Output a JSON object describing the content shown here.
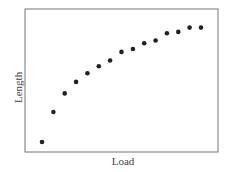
{
  "chart_data": {
    "type": "scatter",
    "title": "",
    "xlabel": "Load",
    "ylabel": "Length",
    "x": [
      1,
      2,
      3,
      4,
      5,
      6,
      7,
      8,
      9,
      10,
      11,
      12,
      13,
      14,
      15
    ],
    "y": [
      7,
      28,
      41,
      49,
      55,
      60,
      64,
      70,
      72,
      76,
      78,
      83,
      84,
      87,
      87
    ],
    "xlim": [
      0,
      17.5
    ],
    "ylim": [
      0,
      100
    ],
    "grid": false,
    "legend": null,
    "ticks": "none",
    "marker_color": "#222222",
    "frame_color": "#777777"
  }
}
